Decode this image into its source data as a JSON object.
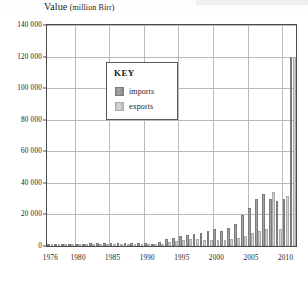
{
  "chart_data": {
    "type": "bar",
    "title": "Value (million Birr)",
    "title_main": "Value",
    "title_unit": "(million Birr)",
    "xlabel": "",
    "ylabel": "Value (million Birr)",
    "ylim": [
      0,
      140000
    ],
    "ytick_step": 20000,
    "ytick_labels": [
      "0",
      "20 000",
      "40 000",
      "60 000",
      "80 000",
      "100 000",
      "120 000",
      "140 000"
    ],
    "ytick_values": [
      0,
      20000,
      40000,
      60000,
      80000,
      100000,
      120000,
      140000
    ],
    "xtick_labels": [
      "1976",
      "1980",
      "1985",
      "1990",
      "1995",
      "2000",
      "2005",
      "2010"
    ],
    "xtick_values": [
      1976,
      1980,
      1985,
      1990,
      1995,
      2000,
      2005,
      2010
    ],
    "grid": true,
    "legend_position": "inside-top-left",
    "legend_title": "KEY",
    "categories": [
      "1976",
      "1977",
      "1978",
      "1979",
      "1980",
      "1981",
      "1982",
      "1983",
      "1984",
      "1985",
      "1986",
      "1987",
      "1988",
      "1989",
      "1990",
      "1991",
      "1992",
      "1993",
      "1994",
      "1995",
      "1996",
      "1997",
      "1998",
      "1999",
      "2000",
      "2001",
      "2002",
      "2003",
      "2004",
      "2005",
      "2006",
      "2007",
      "2008",
      "2009",
      "2010",
      "2011"
    ],
    "series": [
      {
        "name": "imports",
        "color": "#9a9a9a",
        "values": [
          900,
          1000,
          1100,
          1200,
          1400,
          1500,
          1600,
          1700,
          1800,
          1900,
          1800,
          1700,
          1900,
          1800,
          2000,
          1500,
          2400,
          4500,
          5200,
          6500,
          7000,
          7400,
          8000,
          9500,
          10500,
          9800,
          11500,
          14000,
          19500,
          24000,
          30000,
          33000,
          30000,
          28500,
          30000,
          120000
        ]
      },
      {
        "name": "exports",
        "color": "#cccccc",
        "values": [
          700,
          800,
          850,
          900,
          1000,
          1050,
          1100,
          1150,
          1200,
          1250,
          1200,
          1100,
          1150,
          1100,
          1200,
          900,
          1400,
          2600,
          3200,
          3800,
          4200,
          4500,
          4000,
          3600,
          4100,
          3900,
          4400,
          5200,
          6500,
          8000,
          9500,
          11000,
          34000,
          10500,
          32000,
          120000
        ]
      }
    ]
  }
}
